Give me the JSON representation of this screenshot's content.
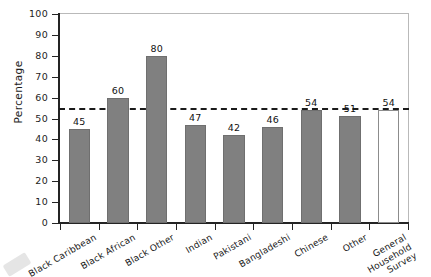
{
  "chart_data": {
    "type": "bar",
    "title": "",
    "xlabel": "",
    "ylabel": "Percentage",
    "ylim": [
      0,
      100
    ],
    "ytick_step": 10,
    "yticks": [
      "0",
      "10",
      "20",
      "30",
      "40",
      "50",
      "60",
      "70",
      "80",
      "90",
      "100"
    ],
    "grid": false,
    "legend": "none",
    "categories": [
      "Black Caribbean",
      "Black African",
      "Black Other",
      "Indian",
      "Pakistani",
      "Bangladeshi",
      "Chinese",
      "Other",
      "General\nHousehold\nSurvey"
    ],
    "values": [
      45,
      60,
      80,
      47,
      42,
      46,
      54,
      51,
      54
    ],
    "value_labels": [
      "45",
      "60",
      "80",
      "47",
      "42",
      "46",
      "54",
      "51",
      "54"
    ],
    "bar_styles": [
      "filled",
      "filled",
      "filled",
      "filled",
      "filled",
      "filled",
      "filled",
      "filled",
      "hollow"
    ],
    "reference_line": {
      "value": 55,
      "style": "dashed",
      "label": ""
    },
    "colors": {
      "bar_fill": "#808080",
      "bar_edge": "#6f6f6f",
      "hollow_fill": "#ffffff",
      "hollow_edge": "#8c8c8c",
      "axis": "#242424",
      "frame": "#b9b9b9",
      "reference_line": "#1b1b1b",
      "text": "#1a1a1a",
      "background": "#ffffff"
    }
  }
}
